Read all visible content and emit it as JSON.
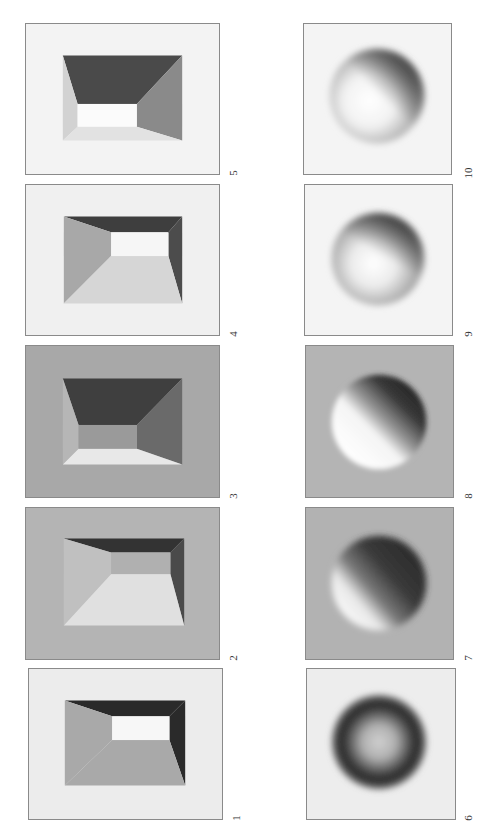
{
  "figure": {
    "orientation": "rotated 90° counter-clockwise",
    "rows": [
      {
        "name": "room-stimuli",
        "panels": [
          {
            "label": "1",
            "background": "#ececec"
          },
          {
            "label": "2",
            "background": "#b4b4b4"
          },
          {
            "label": "3",
            "background": "#a8a8a8"
          },
          {
            "label": "4",
            "background": "#f0f0f0"
          },
          {
            "label": "5",
            "background": "#f3f3f3"
          }
        ]
      },
      {
        "name": "sphere-stimuli",
        "panels": [
          {
            "label": "6",
            "background": "#ededed"
          },
          {
            "label": "7",
            "background": "#b2b2b2"
          },
          {
            "label": "8",
            "background": "#b4b4b4"
          },
          {
            "label": "9",
            "background": "#f4f4f4"
          },
          {
            "label": "10",
            "background": "#f4f4f4"
          }
        ]
      }
    ]
  }
}
